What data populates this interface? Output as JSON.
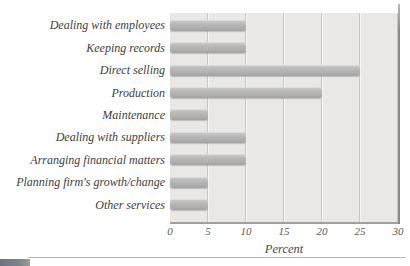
{
  "chart_data": {
    "type": "bar",
    "orientation": "horizontal",
    "title": "",
    "categories": [
      "Dealing with employees",
      "Keeping records",
      "Direct selling",
      "Production",
      "Maintenance",
      "Dealing with suppliers",
      "Arranging financial matters",
      "Planning firm's growth/change",
      "Other services"
    ],
    "values": [
      10,
      10,
      25,
      20,
      5,
      10,
      10,
      5,
      5
    ],
    "xlabel": "Percent",
    "xlim": [
      0,
      30
    ],
    "xticks": [
      0,
      5,
      10,
      15,
      20,
      25,
      30
    ],
    "grid": true,
    "legend": "none",
    "colors": {
      "bar": "#b5b5b5",
      "plot_background": "#e9e8e6",
      "gridline": "#c6c6c5",
      "plot_right_edge": "#8a8a8a",
      "text": "#3d3d3d",
      "corner_artifact": "#69747a"
    }
  }
}
